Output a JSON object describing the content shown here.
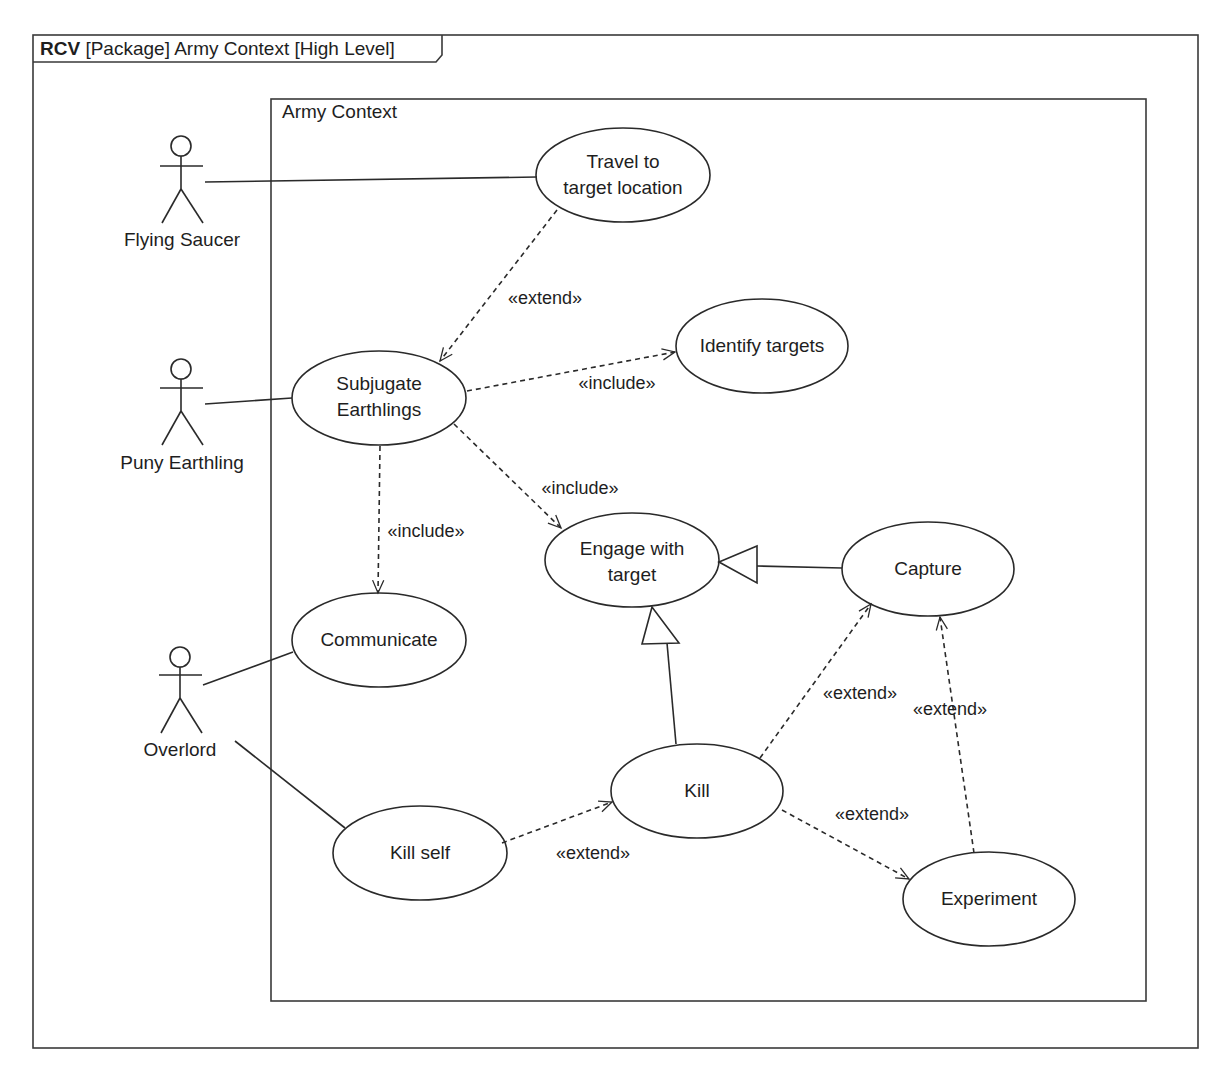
{
  "frame": {
    "keyword": "RCV",
    "title": "[Package] Army Context [High Level]"
  },
  "boundary": {
    "title": "Army Context"
  },
  "actors": [
    {
      "id": "flying-saucer",
      "label": "Flying Saucer"
    },
    {
      "id": "puny-earthling",
      "label": "Puny Earthling"
    },
    {
      "id": "overlord",
      "label": "Overlord"
    }
  ],
  "use_cases": [
    {
      "id": "travel",
      "label": "Travel to\ntarget location"
    },
    {
      "id": "subjugate",
      "label": "Subjugate\nEarthlings"
    },
    {
      "id": "identify",
      "label": "Identify targets"
    },
    {
      "id": "engage",
      "label": "Engage with\ntarget"
    },
    {
      "id": "capture",
      "label": "Capture"
    },
    {
      "id": "communicate",
      "label": "Communicate"
    },
    {
      "id": "kill",
      "label": "Kill"
    },
    {
      "id": "kill-self",
      "label": "Kill self"
    },
    {
      "id": "experiment",
      "label": "Experiment"
    }
  ],
  "relationships": [
    {
      "from": "travel",
      "to": "subjugate",
      "type": "extend",
      "label": "«extend»"
    },
    {
      "from": "subjugate",
      "to": "identify",
      "type": "include",
      "label": "«include»"
    },
    {
      "from": "subjugate",
      "to": "engage",
      "type": "include",
      "label": "«include»"
    },
    {
      "from": "subjugate",
      "to": "communicate",
      "type": "include",
      "label": "«include»"
    },
    {
      "from": "capture",
      "to": "engage",
      "type": "generalization",
      "label": ""
    },
    {
      "from": "kill",
      "to": "engage",
      "type": "generalization",
      "label": ""
    },
    {
      "from": "kill",
      "to": "capture",
      "type": "extend",
      "label": "«extend»"
    },
    {
      "from": "experiment",
      "to": "capture",
      "type": "extend",
      "label": "«extend»"
    },
    {
      "from": "kill",
      "to": "experiment",
      "type": "extend",
      "label": "«extend»"
    },
    {
      "from": "kill-self",
      "to": "kill",
      "type": "extend",
      "label": "«extend»"
    }
  ],
  "associations": [
    {
      "actor": "flying-saucer",
      "use_case": "travel"
    },
    {
      "actor": "puny-earthling",
      "use_case": "subjugate"
    },
    {
      "actor": "overlord",
      "use_case": "communicate"
    },
    {
      "actor": "overlord",
      "use_case": "kill-self"
    }
  ],
  "colors": {
    "line": "#2a2a2a",
    "background": "#ffffff"
  }
}
